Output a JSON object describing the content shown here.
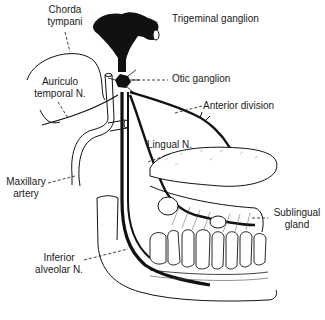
{
  "figure": {
    "colors": {
      "ink": "#111111",
      "background": "#ffffff"
    }
  },
  "labels": {
    "chorda_tympani": {
      "line1": "Chorda",
      "line2": "tympani"
    },
    "trigeminal_ganglion": "Trigeminal ganglion",
    "otic_ganglion": "Otic ganglion",
    "auriculotemporal": {
      "line1": "Auriculo",
      "line2": "temporal N."
    },
    "anterior_division": "Anterior division",
    "lingual_nerve": "Lingual N.",
    "maxillary_artery": {
      "line1": "Maxillary",
      "line2": "artery"
    },
    "sublingual_gland": {
      "line1": "Sublingual",
      "line2": "gland"
    },
    "inferior_alveolar": {
      "line1": "Inferior",
      "line2": "alveolar N."
    }
  }
}
